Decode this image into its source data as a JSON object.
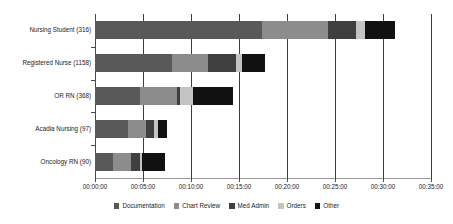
{
  "chart_data": {
    "type": "bar",
    "orientation": "horizontal",
    "stacked": true,
    "title": "",
    "subtitle": "",
    "xlabel": "",
    "ylabel": "",
    "grid": true,
    "legend_position": "bottom",
    "xlim": [
      "00:00:00",
      "00:35:00"
    ],
    "x_tick_labels": [
      "00:00:00",
      "00:05:00",
      "00:10:00",
      "00:15:00",
      "00:20:00",
      "00:25:00",
      "00:30:00",
      "00:35:00"
    ],
    "x_tick_minutes": [
      0,
      5,
      10,
      15,
      20,
      25,
      30,
      35
    ],
    "categories": [
      "Nursing Student (316)",
      "Registered Nurse (1158)",
      "OR RN (368)",
      "Acadia Nursing (97)",
      "Oncology RN (90)"
    ],
    "series": [
      {
        "name": "Documentation",
        "color": "#595959",
        "values_minutes": [
          17.4,
          8.0,
          4.7,
          3.4,
          1.9
        ],
        "values_hms": [
          "00:17:24",
          "00:08:00",
          "00:04:42",
          "00:03:24",
          "00:01:54"
        ]
      },
      {
        "name": "Chart Review",
        "color": "#8c8c8c",
        "values_minutes": [
          6.9,
          3.8,
          3.8,
          1.9,
          1.9
        ],
        "values_hms": [
          "00:06:54",
          "00:03:48",
          "00:03:45",
          "00:01:54",
          "00:01:54"
        ]
      },
      {
        "name": "Med Admin",
        "color": "#3f3f3f",
        "values_minutes": [
          2.9,
          2.9,
          0.4,
          0.8,
          0.9
        ],
        "values_hms": [
          "00:02:54",
          "00:02:54",
          "00:00:25",
          "00:00:48",
          "00:00:54"
        ]
      },
      {
        "name": "Orders",
        "color": "#c4c4c4",
        "values_minutes": [
          0.9,
          0.6,
          1.3,
          0.5,
          0.2
        ],
        "values_hms": [
          "00:00:54",
          "00:00:38",
          "00:01:15",
          "00:00:30",
          "00:00:12"
        ]
      },
      {
        "name": "Other",
        "color": "#111111",
        "values_minutes": [
          3.2,
          2.4,
          4.2,
          0.9,
          2.4
        ],
        "values_hms": [
          "00:03:12",
          "00:02:24",
          "00:04:10",
          "00:00:54",
          "00:02:24"
        ]
      }
    ],
    "totals_minutes": [
      31.3,
      17.7,
      14.4,
      7.5,
      7.3
    ],
    "totals_hms": [
      "00:31:18",
      "00:17:42",
      "00:14:25",
      "00:07:30",
      "00:07:18"
    ]
  }
}
